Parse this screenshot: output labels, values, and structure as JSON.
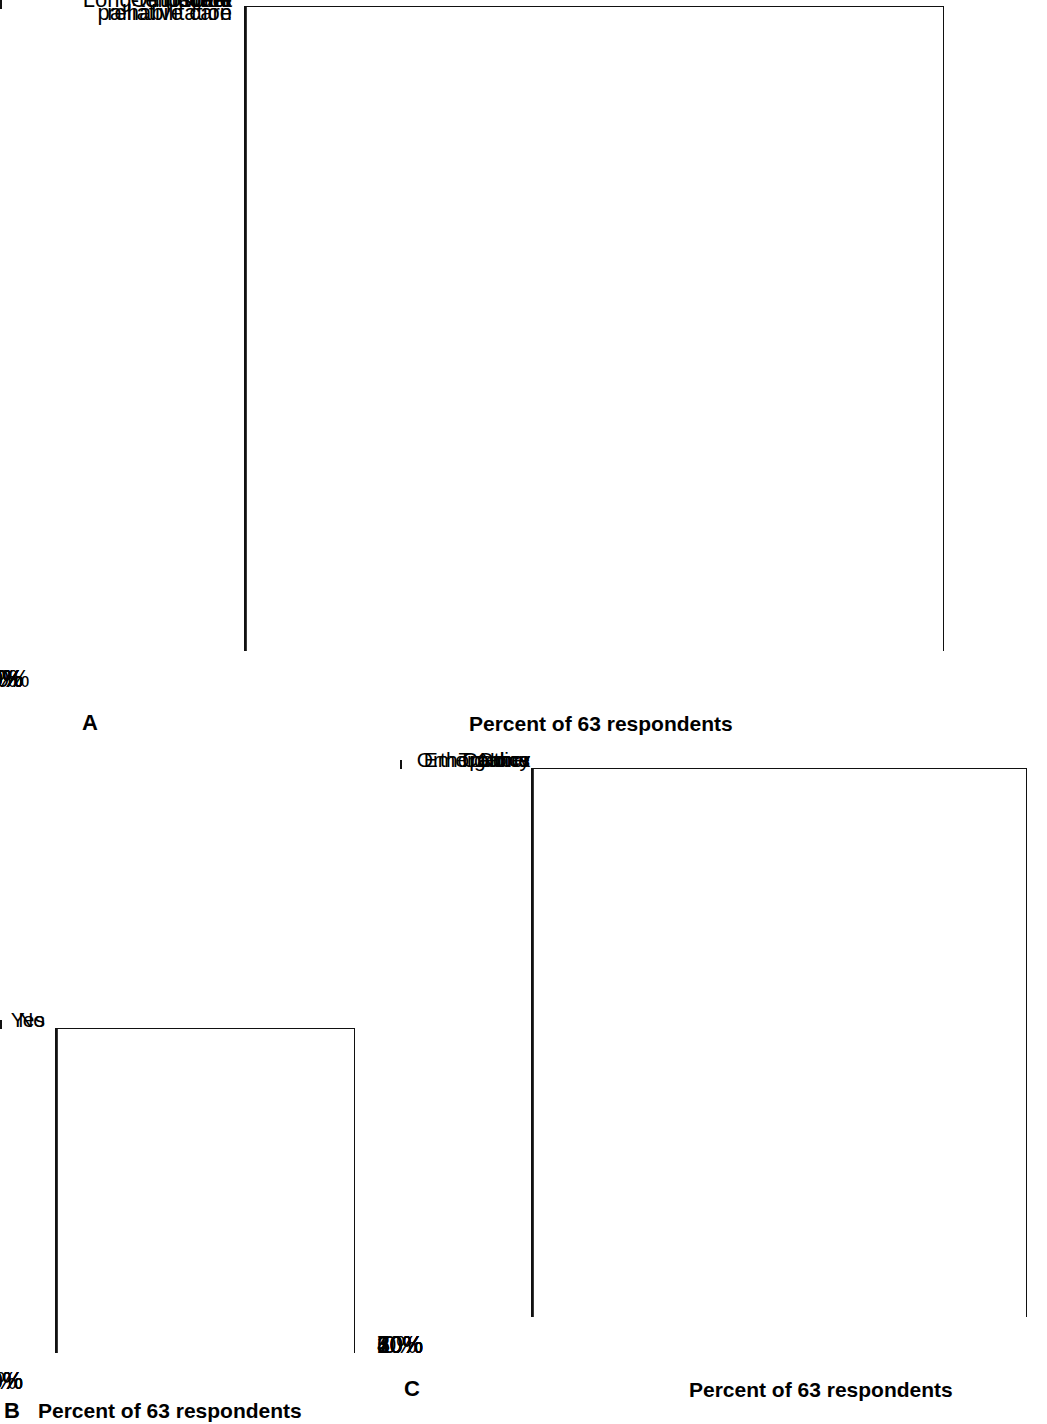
{
  "figure": {
    "background": "#ffffff",
    "axis_color": "#111111"
  },
  "panels": [
    {
      "letter": "A",
      "axis_title": "Percent of 63 respondents",
      "chart_data": {
        "type": "bar",
        "orientation": "horizontal",
        "title": "",
        "xlabel": "Percent of 63 respondents",
        "ylabel": "",
        "xlim": [
          0,
          100
        ],
        "xticks": [
          0,
          10,
          20,
          30,
          40,
          50,
          60,
          70,
          80,
          90,
          100
        ],
        "xticklabels": [
          "0%",
          "10%",
          "20%",
          "30%",
          "40%",
          "50%",
          "60%",
          "70%",
          "80%",
          "90%",
          "100%"
        ],
        "grid": true,
        "legend": "none",
        "categories": [
          "Hospital",
          "Outpatient",
          "Home",
          "Long-term care",
          "Post-acute/\nrehabilitation",
          "Hospice/\npalliative care",
          "Other"
        ],
        "values": [
          97,
          87.5,
          68.5,
          81,
          62,
          59,
          21
        ],
        "colors": [
          "#8c8c8c",
          "#4a4a4a",
          "#c4c4c4",
          "#9a9a9a",
          "#808080",
          "#808080",
          "#6e6e6e"
        ]
      }
    },
    {
      "letter": "B",
      "axis_title": "Percent of 63 respondents",
      "chart_data": {
        "type": "bar",
        "orientation": "horizontal",
        "title": "",
        "xlabel": "Percent of 63 respondents",
        "ylabel": "",
        "xlim": [
          0,
          40
        ],
        "xticks": [
          0,
          10,
          20,
          30,
          40
        ],
        "xticklabels": [
          "0%",
          "10%",
          "20%",
          "30%",
          "40%"
        ],
        "grid": true,
        "legend": "none",
        "categories": [
          "Yes",
          "No"
        ],
        "values": [
          26.5,
          11.5
        ],
        "colors": [
          "#8c8c8c",
          "#585858"
        ]
      }
    },
    {
      "letter": "C",
      "axis_title": "Percent of 63 respondents",
      "chart_data": {
        "type": "bar",
        "orientation": "horizontal",
        "title": "",
        "xlabel": "Percent of 63 respondents",
        "ylabel": "",
        "xlim": [
          0,
          70
        ],
        "xticks": [
          0,
          10,
          20,
          30,
          40,
          50,
          60,
          70
        ],
        "xticklabels": [
          "0%",
          "10%",
          "20%",
          "30%",
          "40%",
          "50%",
          "60%",
          "70%"
        ],
        "grid": true,
        "legend": "none",
        "categories": [
          "Orthopedics",
          "Cancer",
          "Trauma",
          "Emergency",
          "None",
          "Other"
        ],
        "values": [
          64,
          35.5,
          32,
          38.5,
          3.5,
          62
        ],
        "colors": [
          "#989898",
          "#4a4a4a",
          "#c2c2c2",
          "#a8a8a8",
          "#8c8c8c",
          "#6e6e6e"
        ]
      }
    }
  ]
}
